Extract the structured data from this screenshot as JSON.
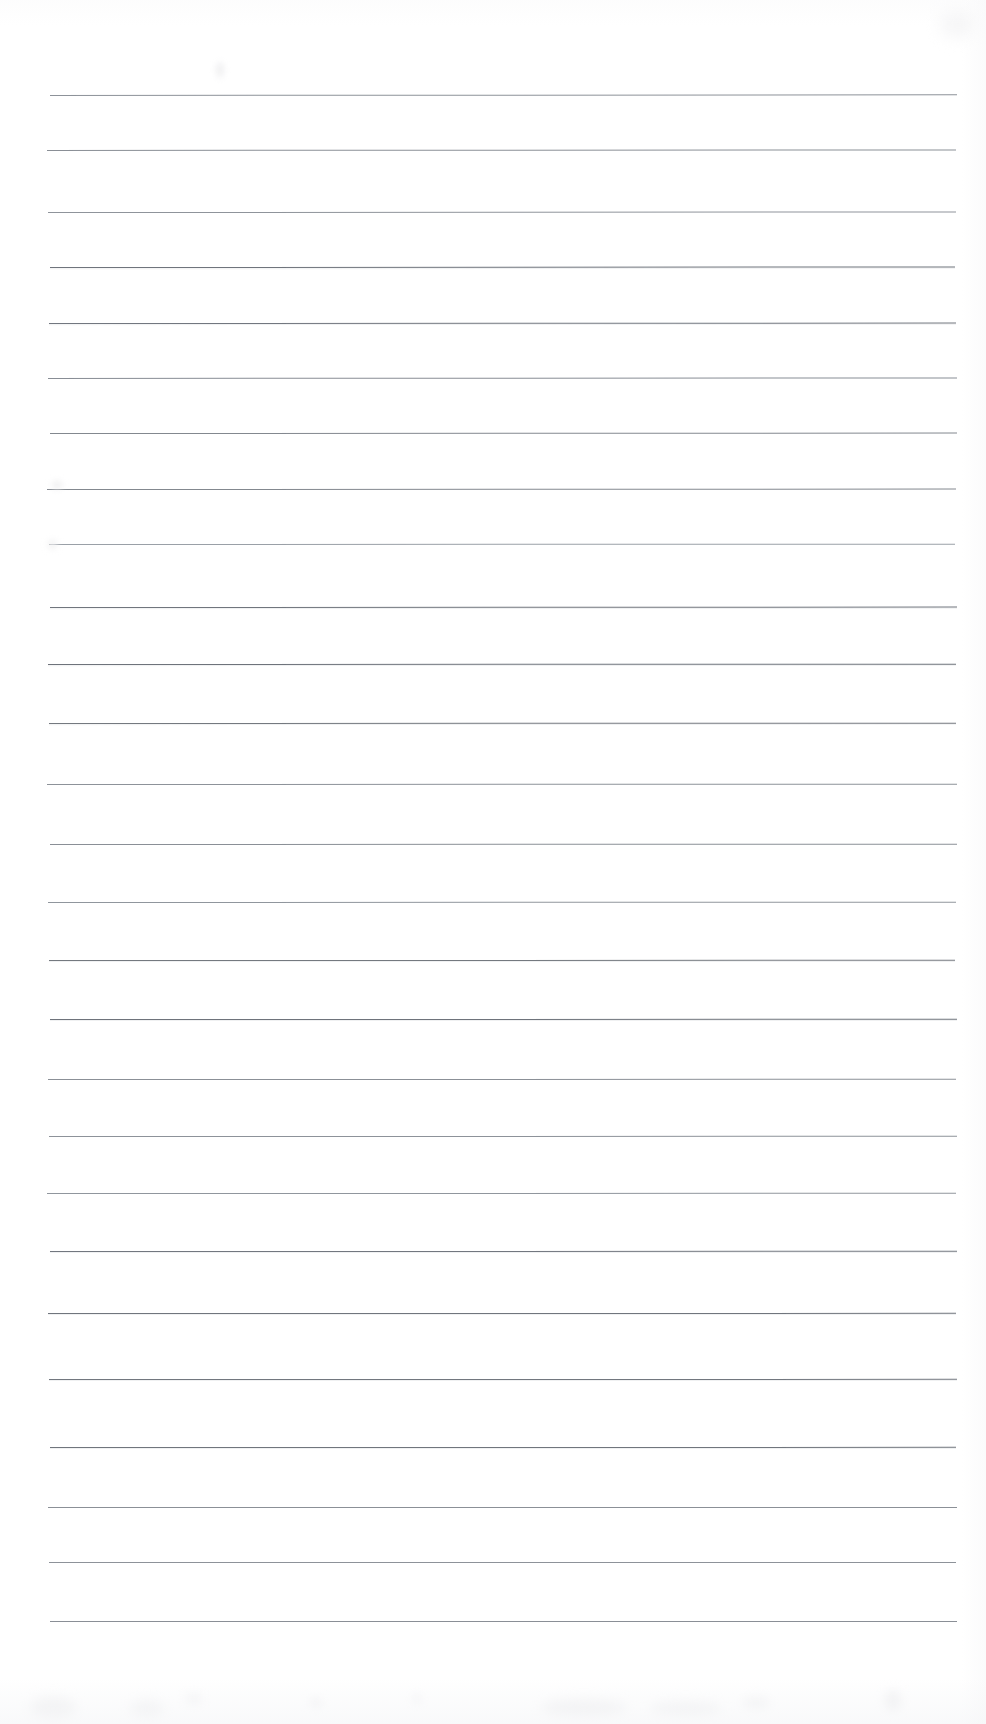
{
  "document": {
    "kind": "scanned-lined-paper",
    "title": "",
    "page_width": 986,
    "page_height": 1724,
    "background_color": "#ffffff",
    "ink_color": "#5b6068",
    "visible_text": "",
    "notes": "Blank ruled notebook page, no handwriting or printed text present"
  },
  "ruling": {
    "line_count": 25,
    "left_margin_x": 51,
    "right_margin_x": 958,
    "first_line_y": 96,
    "spacing_px": 63.6,
    "default_color": "#6a7079",
    "lines": [
      {
        "y": 96,
        "x1": 50,
        "x2": 957,
        "color": "#8d9299",
        "weight": 1.0,
        "slope": -1.6,
        "halo": false
      },
      {
        "y": 151,
        "x1": 47,
        "x2": 956,
        "color": "#8a8f96",
        "weight": 1.0,
        "slope": -1.4,
        "halo": false
      },
      {
        "y": 213,
        "x1": 48,
        "x2": 956,
        "color": "#8f949b",
        "weight": 1.0,
        "slope": -1.2,
        "halo": false
      },
      {
        "y": 268,
        "x1": 50,
        "x2": 955,
        "color": "#6f747c",
        "weight": 1.0,
        "slope": -1.1,
        "halo": true
      },
      {
        "y": 324,
        "x1": 49,
        "x2": 956,
        "color": "#72777f",
        "weight": 1.0,
        "slope": -1.0,
        "halo": true
      },
      {
        "y": 379,
        "x1": 48,
        "x2": 957,
        "color": "#888d95",
        "weight": 1.0,
        "slope": -1.3,
        "halo": false
      },
      {
        "y": 434,
        "x1": 50,
        "x2": 957,
        "color": "#83888f",
        "weight": 1.0,
        "slope": -1.0,
        "halo": false
      },
      {
        "y": 490,
        "x1": 47,
        "x2": 956,
        "color": "#83888f",
        "weight": 1.0,
        "slope": -0.9,
        "halo": false
      },
      {
        "y": 545,
        "x1": 49,
        "x2": 955,
        "color": "#9aa0a7",
        "weight": 1.0,
        "slope": -0.8,
        "halo": false
      },
      {
        "y": 608,
        "x1": 50,
        "x2": 957,
        "color": "#70757d",
        "weight": 1.0,
        "slope": -0.9,
        "halo": true
      },
      {
        "y": 665,
        "x1": 48,
        "x2": 956,
        "color": "#6e737b",
        "weight": 1.0,
        "slope": -0.7,
        "halo": true
      },
      {
        "y": 724,
        "x1": 49,
        "x2": 956,
        "color": "#74797f",
        "weight": 1.0,
        "slope": -0.8,
        "halo": true
      },
      {
        "y": 785,
        "x1": 47,
        "x2": 957,
        "color": "#8d9299",
        "weight": 1.0,
        "slope": -0.7,
        "halo": false
      },
      {
        "y": 845,
        "x1": 50,
        "x2": 957,
        "color": "#8a8f96",
        "weight": 1.0,
        "slope": -0.6,
        "halo": false
      },
      {
        "y": 903,
        "x1": 48,
        "x2": 956,
        "color": "#9096 9d",
        "weight": 1.0,
        "slope": -0.6,
        "halo": false
      },
      {
        "y": 961,
        "x1": 49,
        "x2": 955,
        "color": "#74797f",
        "weight": 1.0,
        "slope": -0.5,
        "halo": true
      },
      {
        "y": 1020,
        "x1": 50,
        "x2": 957,
        "color": "#6e737b",
        "weight": 1.0,
        "slope": -0.5,
        "halo": true
      },
      {
        "y": 1080,
        "x1": 48,
        "x2": 956,
        "color": "#8b9097",
        "weight": 1.0,
        "slope": -0.5,
        "halo": false
      },
      {
        "y": 1137,
        "x1": 49,
        "x2": 957,
        "color": "#8d9299",
        "weight": 1.0,
        "slope": -0.4,
        "halo": false
      },
      {
        "y": 1194,
        "x1": 47,
        "x2": 956,
        "color": "#9096 9d",
        "weight": 1.0,
        "slope": -0.4,
        "halo": false
      },
      {
        "y": 1252,
        "x1": 50,
        "x2": 957,
        "color": "#72777f",
        "weight": 1.0,
        "slope": -0.4,
        "halo": true
      },
      {
        "y": 1314,
        "x1": 48,
        "x2": 956,
        "color": "#70757d",
        "weight": 1.0,
        "slope": -0.3,
        "halo": true
      },
      {
        "y": 1380,
        "x1": 49,
        "x2": 957,
        "color": "#72777f",
        "weight": 1.0,
        "slope": -0.3,
        "halo": true
      },
      {
        "y": 1448,
        "x1": 50,
        "x2": 956,
        "color": "#70757d",
        "weight": 1.0,
        "slope": -0.3,
        "halo": true
      },
      {
        "y": 1508,
        "x1": 48,
        "x2": 957,
        "color": "#8b9097",
        "weight": 1.0,
        "slope": -0.2,
        "halo": false
      },
      {
        "y": 1563,
        "x1": 49,
        "x2": 956,
        "color": "#8d9299",
        "weight": 1.0,
        "slope": -0.2,
        "halo": false
      },
      {
        "y": 1622,
        "x1": 50,
        "x2": 957,
        "color": "#8a8f96",
        "weight": 1.0,
        "slope": -0.2,
        "halo": false
      }
    ]
  },
  "artifacts": {
    "smudges": [
      {
        "x": 216,
        "y": 62,
        "w": 8,
        "h": 16,
        "color": "#f0f0f1",
        "blur": 3
      },
      {
        "x": 52,
        "y": 481,
        "w": 10,
        "h": 8,
        "color": "#eeeeef",
        "blur": 3
      },
      {
        "x": 48,
        "y": 540,
        "w": 9,
        "h": 9,
        "color": "#f1f1f2",
        "blur": 3
      },
      {
        "x": 30,
        "y": 1697,
        "w": 46,
        "h": 22,
        "color": "#f4f4f5",
        "blur": 6
      },
      {
        "x": 130,
        "y": 1700,
        "w": 34,
        "h": 18,
        "color": "#f5f5f6",
        "blur": 6
      },
      {
        "x": 186,
        "y": 1693,
        "w": 16,
        "h": 12,
        "color": "#f6f6f7",
        "blur": 5
      },
      {
        "x": 310,
        "y": 1698,
        "w": 12,
        "h": 10,
        "color": "#f4f4f5",
        "blur": 4
      },
      {
        "x": 412,
        "y": 1694,
        "w": 10,
        "h": 10,
        "color": "#f6f6f7",
        "blur": 4
      },
      {
        "x": 541,
        "y": 1700,
        "w": 86,
        "h": 16,
        "color": "#f3f3f4",
        "blur": 6
      },
      {
        "x": 650,
        "y": 1702,
        "w": 72,
        "h": 14,
        "color": "#f4f4f5",
        "blur": 6
      },
      {
        "x": 742,
        "y": 1696,
        "w": 28,
        "h": 14,
        "color": "#f6f6f7",
        "blur": 5
      },
      {
        "x": 884,
        "y": 1690,
        "w": 18,
        "h": 22,
        "color": "#f4f4f5",
        "blur": 5
      },
      {
        "x": 940,
        "y": 8,
        "w": 36,
        "h": 30,
        "color": "#f6f6f7",
        "blur": 8
      }
    ]
  }
}
